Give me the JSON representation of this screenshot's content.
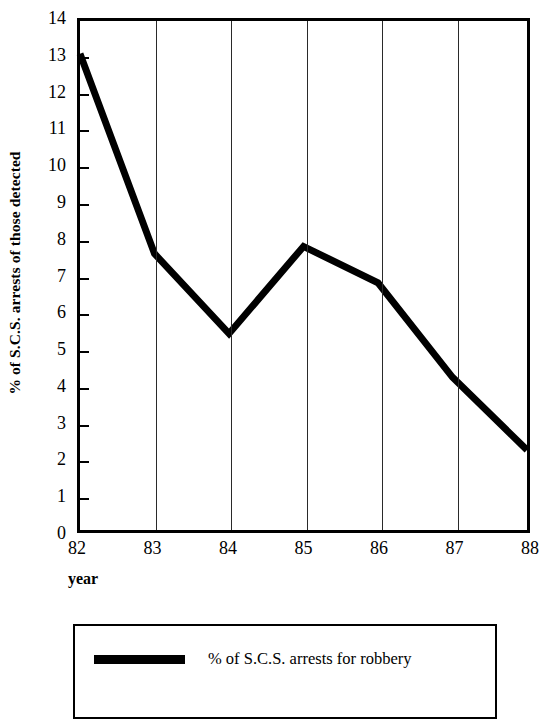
{
  "chart_data": {
    "type": "line",
    "title": "",
    "subtitle": "",
    "xlabel": "year",
    "ylabel": "% of S.C.S. arrests of those detected",
    "x": [
      "82",
      "83",
      "84",
      "85",
      "86",
      "87",
      "88"
    ],
    "categories": [
      "82",
      "83",
      "84",
      "85",
      "86",
      "87",
      "88"
    ],
    "series": [
      {
        "name": "% of S.C.S. arrests for robbery",
        "values": [
          13.1,
          7.6,
          5.4,
          7.8,
          6.8,
          4.2,
          2.2
        ],
        "color": "#000000",
        "line_width": 7
      }
    ],
    "xlim": [
      82,
      88
    ],
    "ylim": [
      0,
      14
    ],
    "y_ticks": [
      0,
      1,
      2,
      3,
      4,
      5,
      6,
      7,
      8,
      9,
      10,
      11,
      12,
      13,
      14
    ],
    "y_tick_labels": [
      "0",
      "1",
      "2",
      "3",
      "4",
      "5",
      "6",
      "7",
      "8",
      "9",
      "10",
      "11",
      "12",
      "13",
      "14"
    ],
    "x_ticks": [
      82,
      83,
      84,
      85,
      86,
      87,
      88
    ],
    "x_tick_labels": [
      "82",
      "83",
      "84",
      "85",
      "86",
      "87",
      "88"
    ],
    "gridlines_vertical_at": [
      83,
      84,
      85,
      86,
      87
    ],
    "grid": "vertical-only",
    "legend_position": "below-plot",
    "legend_entries": [
      {
        "label": "% of S.C.S. arrests for robbery",
        "marker": "thick-line",
        "color": "#000000"
      }
    ],
    "frame": true,
    "background_color": "#ffffff",
    "axis_color": "#000000"
  },
  "axes": {
    "y_title": "% of S.C.S. arrests of those detected",
    "x_title": "year"
  },
  "legend": {
    "entry_label": "% of S.C.S. arrests for robbery"
  }
}
